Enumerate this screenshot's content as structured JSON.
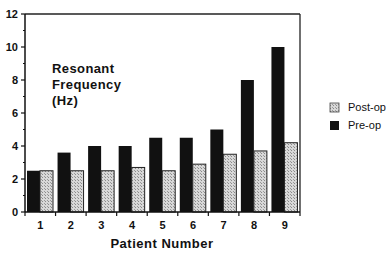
{
  "chart_data": {
    "type": "bar",
    "title": "",
    "xlabel": "Patient Number",
    "ylabel": "Resonant Frequency (Hz)",
    "annotation_lines": [
      "Resonant",
      "Frequency",
      "(Hz)"
    ],
    "categories": [
      "1",
      "2",
      "3",
      "4",
      "5",
      "6",
      "7",
      "8",
      "9"
    ],
    "series": [
      {
        "name": "Pre-op",
        "color": "#111111",
        "pattern": "solid",
        "values": [
          2.5,
          3.6,
          4.0,
          4.0,
          4.5,
          4.5,
          5.0,
          8.0,
          10.0
        ]
      },
      {
        "name": "Post-op",
        "color": "#cfcfcf",
        "pattern": "stippled",
        "values": [
          2.5,
          2.5,
          2.5,
          2.7,
          2.5,
          2.9,
          3.5,
          3.7,
          4.2
        ]
      }
    ],
    "ylim": [
      0,
      12
    ],
    "yticks": [
      0,
      2,
      4,
      6,
      8,
      10,
      12
    ],
    "grid": false,
    "legend": {
      "position": "right",
      "entries": [
        {
          "label": "Post-op",
          "swatch": "stippled"
        },
        {
          "label": "Pre-op",
          "swatch": "solid"
        }
      ]
    }
  }
}
